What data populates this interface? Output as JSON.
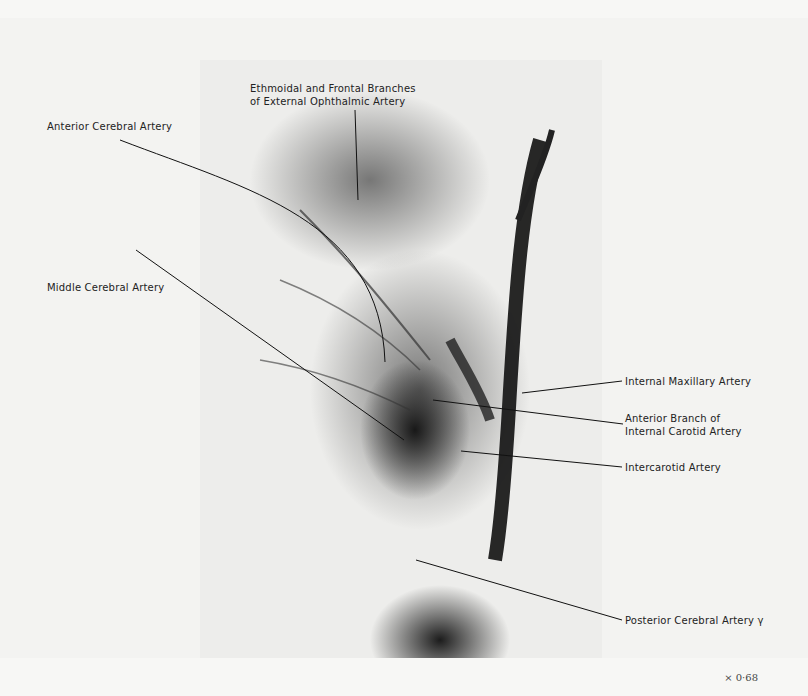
{
  "figure": {
    "labels": {
      "ethmoidal": [
        "Ethmoidal and Frontal Branches",
        "of External Ophthalmic Artery"
      ],
      "anterior_cerebral": "Anterior Cerebral Artery",
      "middle_cerebral": "Middle Cerebral Artery",
      "internal_maxillary": "Internal Maxillary Artery",
      "anterior_branch": [
        "Anterior Branch of",
        "Internal Carotid Artery"
      ],
      "intercarotid": "Intercarotid Artery",
      "posterior_cerebral": "Posterior Cerebral Artery γ"
    },
    "scale": "× 0·68"
  }
}
